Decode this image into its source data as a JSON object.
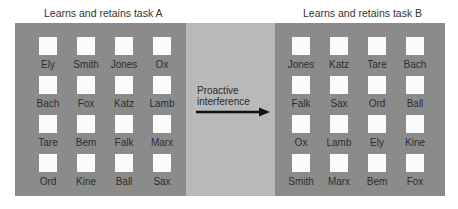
{
  "task_a": {
    "title": "Learns and retains task  A",
    "words": [
      "Ely",
      "Smith",
      "Jones",
      "Ox",
      "Bach",
      "Fox",
      "Katz",
      "Lamb",
      "Tare",
      "Bem",
      "Falk",
      "Marx",
      "Ord",
      "Kine",
      "Ball",
      "Sax"
    ]
  },
  "task_b": {
    "title": "Learns and retains task  B",
    "words": [
      "Jones",
      "Katz",
      "Tare",
      "Bach",
      "Falk",
      "Sax",
      "Ord",
      "Ball",
      "Ox",
      "Lamb",
      "Ely",
      "Kine",
      "Smith",
      "Marx",
      "Bem",
      "Fox"
    ]
  },
  "middle": {
    "label_line1": "Proactive",
    "label_line2": "interference"
  },
  "colors": {
    "panel": "#8b8b8b",
    "middle": "#b9b9b9",
    "square": "#fbfbfb"
  }
}
